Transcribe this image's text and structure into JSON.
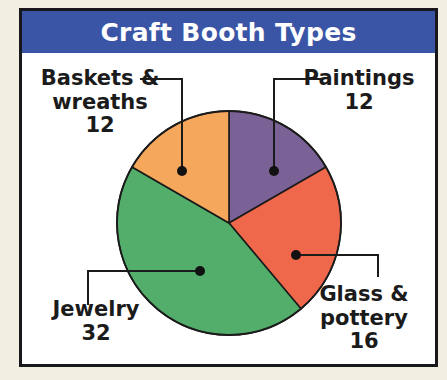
{
  "figure": {
    "title": "Craft Booth Types",
    "title_bar_color": "#3a55a5",
    "title_text_color": "#ffffff",
    "frame_border_color": "#17171c",
    "page_background": "#f2eee2",
    "plot_background": "#ffffff"
  },
  "chart_data": {
    "type": "pie",
    "title": "Craft Booth Types",
    "xlabel": "",
    "ylabel": "",
    "total": 72,
    "start_angle_deg": 0,
    "direction": "clockwise",
    "legend_position": "none",
    "grid": false,
    "labels_with_leader_lines": true,
    "categories": [
      "Paintings",
      "Glass & pottery",
      "Jewelry",
      "Baskets & wreaths"
    ],
    "values": [
      12,
      16,
      32,
      12
    ],
    "colors": [
      "#7b6296",
      "#f0684b",
      "#52ae6a",
      "#f5a75c"
    ],
    "slices": [
      {
        "label": "Paintings",
        "label_line1": "Paintings",
        "label_line2": "",
        "value": 12,
        "value_text": "12",
        "color": "#7b6296",
        "start_deg": 0,
        "end_deg": 60,
        "sweep_deg": 60,
        "percent": 16.7
      },
      {
        "label": "Glass & pottery",
        "label_line1": "Glass &",
        "label_line2": "pottery",
        "value": 16,
        "value_text": "16",
        "color": "#f0684b",
        "start_deg": 60,
        "end_deg": 140,
        "sweep_deg": 80,
        "percent": 22.2
      },
      {
        "label": "Jewelry",
        "label_line1": "Jewelry",
        "label_line2": "",
        "value": 32,
        "value_text": "32",
        "color": "#52ae6a",
        "start_deg": 140,
        "end_deg": 300,
        "sweep_deg": 160,
        "percent": 44.4
      },
      {
        "label": "Baskets & wreaths",
        "label_line1": "Baskets &",
        "label_line2": "wreaths",
        "value": 12,
        "value_text": "12",
        "color": "#f5a75c",
        "start_deg": 300,
        "end_deg": 360,
        "sweep_deg": 60,
        "percent": 16.7
      }
    ]
  }
}
